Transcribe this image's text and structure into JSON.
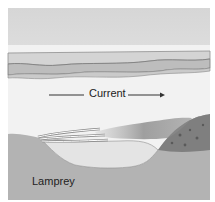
{
  "diagram": {
    "labels": {
      "current": "Current",
      "lamprey": "Lamprey"
    },
    "colors": {
      "background": "#ffffff",
      "water_top": "#d9d9d9",
      "water_bottom": "#f4f4f4",
      "surface_band": "#bdbdbd",
      "surface_band_dark": "#a8a8a8",
      "riverbed": "#b3b3b3",
      "nest_pit": "#e6e6e6",
      "gravel_mound": "#7a7a7a",
      "silt_plume": "#8c8c8c",
      "arrow": "#333333"
    }
  }
}
